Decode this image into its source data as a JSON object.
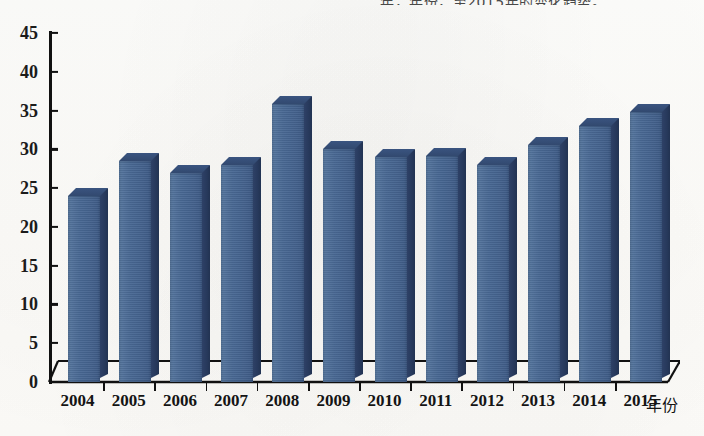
{
  "page": {
    "cut_off_header_text": "年，年份，至2015年的变化趋势。"
  },
  "chart_data": {
    "type": "bar",
    "title": "",
    "subtitle": "",
    "xlabel": "年份",
    "ylabel": "",
    "categories": [
      "2004",
      "2005",
      "2006",
      "2007",
      "2008",
      "2009",
      "2010",
      "2011",
      "2012",
      "2013",
      "2014",
      "2015"
    ],
    "values": [
      24,
      28.5,
      27,
      28,
      35.8,
      30,
      29,
      29.2,
      28,
      30.5,
      33,
      34.8
    ],
    "series": [
      {
        "name": "数值",
        "values": [
          24,
          28.5,
          27,
          28,
          35.8,
          30,
          29,
          29.2,
          28,
          30.5,
          33,
          34.8
        ]
      }
    ],
    "ylim": [
      0,
      45
    ],
    "ytick_values": [
      0,
      5,
      10,
      15,
      20,
      25,
      30,
      35,
      40,
      45
    ],
    "ytick_labels": [
      "0",
      "5",
      "10",
      "15",
      "20",
      "25",
      "30",
      "35",
      "40",
      "45"
    ],
    "grid": false,
    "legend": false,
    "legend_position": "none",
    "style_3d": true,
    "colors": {
      "bar_front": "#496893",
      "bar_side": "#27395c",
      "bar_top": "#32496f",
      "axis": "#111111",
      "background": "#fdfcf9",
      "text": "#141414"
    },
    "annotations": []
  }
}
